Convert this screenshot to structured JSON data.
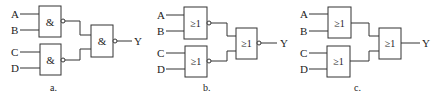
{
  "diagrams": [
    {
      "id": "a",
      "caption": "a.",
      "inputs": [
        "A",
        "B",
        "C",
        "D"
      ],
      "output": "Y",
      "gates": [
        {
          "symbol": "&",
          "inverted_output": true
        },
        {
          "symbol": "&",
          "inverted_output": true
        },
        {
          "symbol": "&",
          "inverted_output": true
        }
      ]
    },
    {
      "id": "b",
      "caption": "b.",
      "inputs": [
        "A",
        "B",
        "C",
        "D"
      ],
      "output": "Y",
      "gates": [
        {
          "symbol": "≥1",
          "inverted_output": true
        },
        {
          "symbol": "≥1",
          "inverted_output": true
        },
        {
          "symbol": "≥1",
          "inverted_output": true
        }
      ]
    },
    {
      "id": "c",
      "caption": "c.",
      "inputs": [
        "A",
        "B",
        "C",
        "D"
      ],
      "output": "Y",
      "gates": [
        {
          "symbol": "≥1",
          "inverted_output": false
        },
        {
          "symbol": "≥1",
          "inverted_output": false
        },
        {
          "symbol": "≥1",
          "inverted_output": false
        }
      ]
    }
  ]
}
